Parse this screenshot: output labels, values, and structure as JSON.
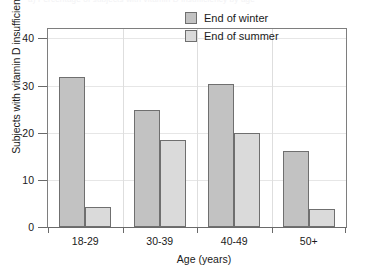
{
  "figure": {
    "top_cropped_text": "a) Percentage of subjects with vitamin D insufficiency by age"
  },
  "chart_data": {
    "type": "bar",
    "title": "",
    "xlabel": "Age (years)",
    "ylabel": "Subjects with vitamin D insufficiency (%)",
    "categories": [
      "18-29",
      "30-39",
      "40-49",
      "50+"
    ],
    "series": [
      {
        "name": "End of winter",
        "values": [
          31.8,
          24.8,
          30.4,
          16.2
        ],
        "color": "#c2c2c2"
      },
      {
        "name": "End of summer",
        "values": [
          4.2,
          18.4,
          20.0,
          3.8
        ],
        "color": "#dadada"
      }
    ],
    "ylim": [
      0,
      42
    ],
    "yticks": [
      0,
      10,
      20,
      30,
      40
    ],
    "ytick_labels": [
      "0",
      "10",
      "20",
      "30",
      "40"
    ],
    "grid": true,
    "legend_position": "upper right"
  }
}
